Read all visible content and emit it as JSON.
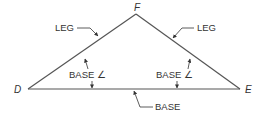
{
  "diagram": {
    "colors": {
      "line": "#555555",
      "text": "#333333",
      "background": "#ffffff"
    },
    "vertices": {
      "apex": {
        "label": "F",
        "x": 136,
        "y": 14
      },
      "left": {
        "label": "D",
        "x": 28,
        "y": 89
      },
      "right": {
        "label": "E",
        "x": 240,
        "y": 89
      }
    },
    "labels": {
      "left_leg": "LEG",
      "right_leg": "LEG",
      "left_base_angle": "BASE ∠",
      "right_base_angle": "BASE ∠",
      "base": "BASE"
    }
  }
}
